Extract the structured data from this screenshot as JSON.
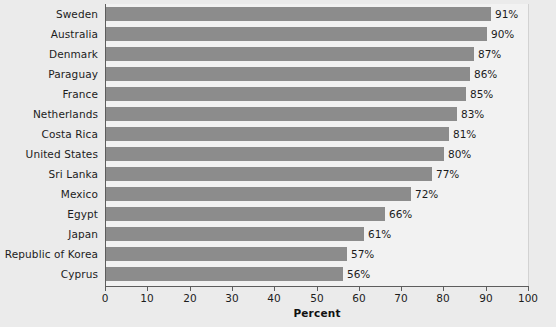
{
  "chart_data": {
    "type": "bar",
    "orientation": "horizontal",
    "title": "",
    "xlabel": "Percent",
    "ylabel": "",
    "xlim": [
      0,
      100
    ],
    "xticks": [
      0,
      10,
      20,
      30,
      40,
      50,
      60,
      70,
      80,
      90,
      100
    ],
    "grid": false,
    "legend": null,
    "bar_color": "#8c8c8c",
    "plot_background": "#f2f2f2",
    "figure_background": "#ebebeb",
    "categories": [
      "Sweden",
      "Australia",
      "Denmark",
      "Paraguay",
      "France",
      "Netherlands",
      "Costa Rica",
      "United States",
      "Sri Lanka",
      "Mexico",
      "Egypt",
      "Japan",
      "Republic of Korea",
      "Cyprus"
    ],
    "values": [
      91,
      90,
      87,
      86,
      85,
      83,
      81,
      80,
      77,
      72,
      66,
      61,
      57,
      56
    ],
    "value_labels": [
      "91%",
      "90%",
      "87%",
      "86%",
      "85%",
      "83%",
      "81%",
      "80%",
      "77%",
      "72%",
      "66%",
      "61%",
      "57%",
      "56%"
    ]
  }
}
